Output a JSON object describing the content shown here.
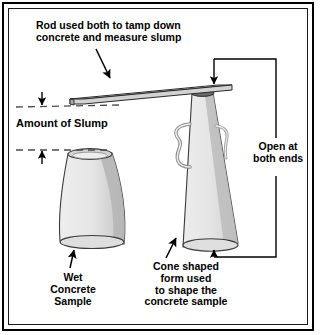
{
  "diagram": {
    "frame": {
      "outer_color": "#000000",
      "inner_color": "#1a1a1a",
      "background": "#ffffff"
    },
    "palette": {
      "outline": "#1a1a1a",
      "face_light": "#e9e9e9",
      "face_mid": "#d9d9d9",
      "face_dark": "#b8b8b8",
      "rim_dark": "#5a5a5a",
      "top_ellipse": "#cfcfcf",
      "dashed_line": "#4a4a4a",
      "text": "#000000"
    }
  },
  "labels": {
    "rod": "Rod used both to tamp down\nconcrete and measure slump",
    "amount_of_slump": "Amount of Slump",
    "open_both_ends": "Open at\nboth ends",
    "wet_concrete_sample": "Wet\nConcrete\nSample",
    "cone_form": "Cone shaped\nform used\nto shape the\nconcrete sample"
  },
  "parts": [
    {
      "name": "tamping-rod",
      "description": "straight steel rod resting on cone top"
    },
    {
      "name": "slump-cone",
      "description": "cone shaped form open at both ends with wire handles"
    },
    {
      "name": "wet-concrete-sample",
      "description": "slumped wet concrete specimen"
    },
    {
      "name": "slump-measure",
      "description": "vertical distance between dashed reference lines"
    }
  ]
}
